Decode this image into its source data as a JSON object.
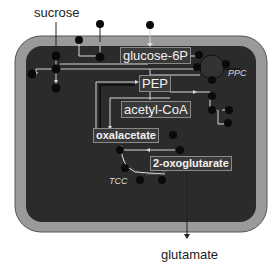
{
  "diagram": {
    "type": "metabolic-pathway",
    "colors": {
      "cell_fill": "#2b2b2b",
      "cell_wall": "#9a9a9a",
      "wall_outline": "#555555",
      "line": "#d8d8d8",
      "node": "#0a0a0a",
      "label_bg": "#3a3a3a",
      "label_border": "#8a8a8a",
      "label_text": "#f2f2f2"
    },
    "external": {
      "sucrose": "sucrose",
      "glutamate": "glutamate"
    },
    "metabolites": {
      "glucose_6p": "glucose-6P",
      "pep": "PEP",
      "acetyl_coa": "acetyl-CoA",
      "oxalacetate": "oxalacetate",
      "oxoglutarate": "2-oxoglutarate"
    },
    "pathways": {
      "ppc": "PPC",
      "tcc": "TCC"
    }
  }
}
